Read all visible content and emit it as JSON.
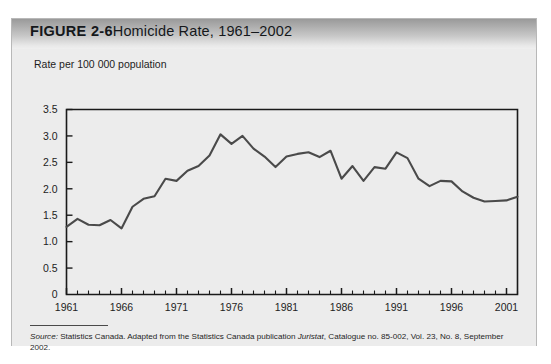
{
  "figure": {
    "label": "FIGURE 2-6",
    "name": "Homicide Rate, 1961–2002"
  },
  "source": {
    "text": "Source: Statistics Canada. Adapted from the Statistics Canada publication Juristat, Catalogue no. 85-002, Vol. 23, No. 8, September 2002.",
    "prefix": "Source:",
    "body_1": " Statistics Canada. Adapted from the Statistics Canada publication ",
    "italic_pub": "Juristat",
    "body_2": ", Catalogue no. 85-002, Vol. 23, No. 8, September 2002."
  },
  "colors": {
    "panel_background": "#ececec",
    "panel_border": "#b8b8b8",
    "title_bar_top": "#9a9a9a",
    "title_bar_bottom": "#efefef",
    "line": "#4a4a4a",
    "axis": "#1a1a1a",
    "text": "#1d1d1d"
  },
  "chart_data": {
    "type": "line",
    "title": "Homicide Rate, 1961–2002",
    "ylabel": "Rate per 100 000 population",
    "xlabel": "",
    "ylim": [
      0,
      3.5
    ],
    "xlim": [
      1961,
      2002
    ],
    "grid": false,
    "legend": null,
    "ytick_labels": [
      "0",
      "0.5",
      "1.0",
      "1.5",
      "2.0",
      "2.5",
      "3.0",
      "3.5"
    ],
    "ytick_values": [
      0,
      0.5,
      1.0,
      1.5,
      2.0,
      2.5,
      3.0,
      3.5
    ],
    "xtick_labels": [
      "1961",
      "1966",
      "1971",
      "1976",
      "1981",
      "1986",
      "1991",
      "1996",
      "2001"
    ],
    "xtick_values": [
      1961,
      1966,
      1971,
      1976,
      1981,
      1986,
      1991,
      1996,
      2001
    ],
    "x_minor_tick_interval": 1,
    "x": [
      1961,
      1962,
      1963,
      1964,
      1965,
      1966,
      1967,
      1968,
      1969,
      1970,
      1971,
      1972,
      1973,
      1974,
      1975,
      1976,
      1977,
      1978,
      1979,
      1980,
      1981,
      1982,
      1983,
      1984,
      1985,
      1986,
      1987,
      1988,
      1989,
      1990,
      1991,
      1992,
      1993,
      1994,
      1995,
      1996,
      1997,
      1998,
      1999,
      2000,
      2001,
      2002
    ],
    "values": [
      1.28,
      1.43,
      1.32,
      1.31,
      1.41,
      1.25,
      1.66,
      1.81,
      1.86,
      2.19,
      2.15,
      2.34,
      2.43,
      2.63,
      3.03,
      2.85,
      3.0,
      2.76,
      2.61,
      2.41,
      2.61,
      2.66,
      2.69,
      2.6,
      2.72,
      2.19,
      2.43,
      2.15,
      2.41,
      2.38,
      2.69,
      2.58,
      2.19,
      2.05,
      2.15,
      2.14,
      1.95,
      1.83,
      1.76,
      1.77,
      1.78,
      1.85
    ],
    "annotations": []
  }
}
